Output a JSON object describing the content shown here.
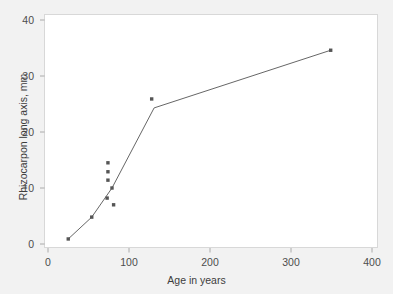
{
  "chart_data": {
    "type": "scatter",
    "title": "",
    "xlabel": "Age in years",
    "ylabel": "Rhizocarpon long axis, mm",
    "xlim": [
      0,
      400
    ],
    "ylim": [
      0,
      40
    ],
    "xticks": [
      0,
      100,
      200,
      300,
      400
    ],
    "yticks": [
      0,
      10,
      20,
      30,
      40
    ],
    "xtick_labels": [
      "0",
      "100",
      "200",
      "300",
      "400"
    ],
    "ytick_labels": [
      "0",
      "10",
      "20",
      "30",
      "40"
    ],
    "grid": false,
    "legend": "none",
    "marker_color": "#555555",
    "line_color": "#555555",
    "background_color": "#f2f2f2",
    "plot_background_color": "#ffffff",
    "frame_color": "#d8d8d8",
    "points": [
      {
        "x": 25,
        "y": 0.9
      },
      {
        "x": 54,
        "y": 4.8
      },
      {
        "x": 73,
        "y": 8.2
      },
      {
        "x": 74,
        "y": 11.4
      },
      {
        "x": 74,
        "y": 12.9
      },
      {
        "x": 74,
        "y": 14.5
      },
      {
        "x": 79,
        "y": 10.0
      },
      {
        "x": 81,
        "y": 7.0
      },
      {
        "x": 128,
        "y": 25.9
      },
      {
        "x": 349,
        "y": 34.6
      }
    ],
    "series": [
      {
        "name": "growth curve",
        "x": [
          25,
          54,
          79,
          131,
          349
        ],
        "values": [
          0.9,
          4.8,
          10.0,
          24.3,
          34.6
        ]
      }
    ]
  }
}
